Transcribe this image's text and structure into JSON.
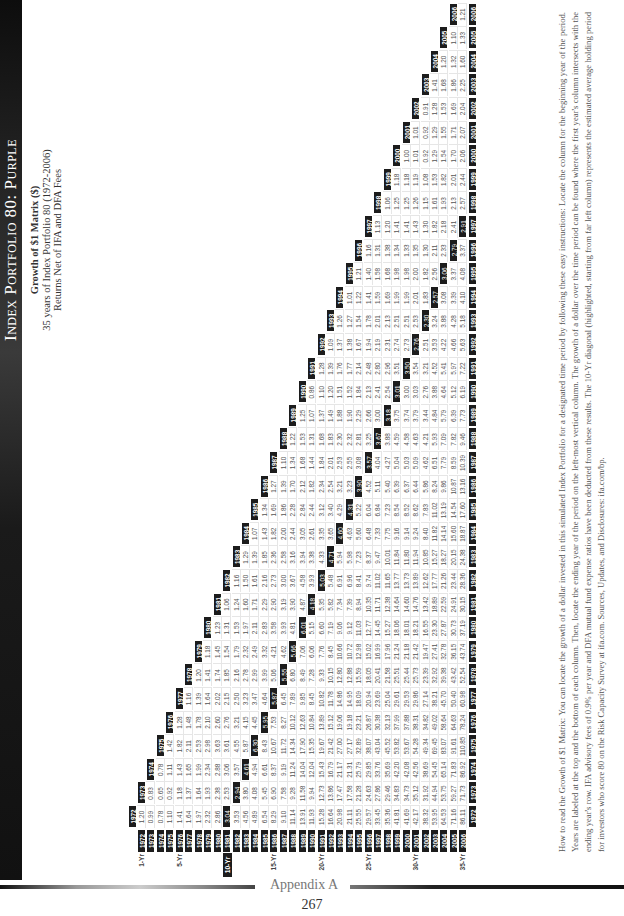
{
  "header": {
    "title": "Index Portfolio 80: Purple",
    "subtitle": "Growth of $1 Matrix ($)",
    "line2": "35 years of Index Portfolio 80 (1972-2006)",
    "line3": "Returns Net of IFA and DFA Fees"
  },
  "footer": {
    "section": "Appendix A",
    "page_number": "267"
  },
  "explanation": "How to read the Growth of $1 Matrix: You can locate the growth of a dollar invested in this simulated Index Portfolio for a designated time period by following these easy instructions: Locate the column for the beginning year of the period. Years are labeled at the top and the bottom of each column. Then, locate the ending year of the period on the left-most vertical column. The growth of a dollar over the time period can be found where the first year's column intersects with the ending year's row. IFA advisory fees of 0.9% per year and DFA mutual fund expense ratios have been deducted from these results. The 10-Yr diagonal (highlighted, starting from far left column) represents the estimated average holding period for investors who score 80 on the Risk Capacity Survey at ifa.com. Sources, Updates, and Disclosures: ifa.com/bp.",
  "matrix": {
    "start_year": 1972,
    "highlight_period_years": 10,
    "period_labels": {
      "1972": "1-Yr",
      "1976": "5-Yr",
      "1981": "10-Yr",
      "1986": "15-Yr",
      "1991": "20-Yr",
      "1996": "25-Yr",
      "2001": "30-Yr",
      "2006": "35-Yr"
    },
    "rows": [
      {
        "end": 1972,
        "values": [
          1.2
        ]
      },
      {
        "end": 1973,
        "values": [
          0.99,
          0.83
        ]
      },
      {
        "end": 1974,
        "values": [
          0.78,
          0.65,
          0.78
        ]
      },
      {
        "end": 1975,
        "values": [
          1.1,
          0.92,
          1.11,
          1.42
        ]
      },
      {
        "end": 1976,
        "values": [
          1.41,
          1.18,
          1.43,
          1.82,
          1.28
        ]
      },
      {
        "end": 1977,
        "values": [
          1.64,
          1.37,
          1.65,
          2.11,
          1.48,
          1.16
        ]
      },
      {
        "end": 1978,
        "values": [
          1.97,
          1.64,
          1.99,
          2.53,
          1.78,
          1.39,
          1.2
        ]
      },
      {
        "end": 1979,
        "values": [
          2.32,
          1.93,
          2.34,
          2.98,
          2.1,
          1.64,
          1.41,
          1.18
        ]
      },
      {
        "end": 1980,
        "values": [
          2.86,
          2.38,
          2.88,
          3.63,
          2.6,
          2.02,
          1.74,
          1.45,
          1.23
        ]
      },
      {
        "end": 1981,
        "values": [
          3.04,
          2.53,
          3.06,
          3.61,
          2.76,
          2.15,
          1.85,
          1.54,
          1.31,
          1.06
        ]
      },
      {
        "end": 1982,
        "values": [
          3.53,
          2.94,
          3.57,
          4.55,
          3.21,
          2.5,
          2.16,
          1.79,
          1.53,
          1.24,
          1.16
        ]
      },
      {
        "end": 1983,
        "values": [
          4.56,
          3.8,
          4.61,
          5.87,
          4.15,
          3.23,
          2.78,
          2.32,
          1.97,
          1.6,
          1.5,
          1.29
        ]
      },
      {
        "end": 1984,
        "values": [
          4.89,
          4.08,
          4.94,
          6.3,
          4.45,
          3.47,
          2.99,
          2.49,
          2.11,
          1.71,
          1.61,
          1.39,
          1.07
        ]
      },
      {
        "end": 1985,
        "values": [
          6.54,
          5.45,
          6.61,
          8.43,
          5.95,
          4.64,
          3.99,
          3.32,
          2.83,
          2.29,
          2.16,
          1.85,
          1.43,
          1.34
        ]
      },
      {
        "end": 1986,
        "values": [
          8.29,
          6.9,
          8.37,
          10.67,
          7.53,
          5.87,
          5.06,
          4.21,
          3.58,
          2.9,
          2.73,
          2.36,
          1.82,
          1.69,
          1.27
        ]
      },
      {
        "end": 1987,
        "values": [
          9.1,
          7.58,
          9.19,
          11.72,
          8.27,
          6.45,
          5.55,
          4.62,
          3.93,
          3.19,
          3.0,
          2.58,
          2.0,
          1.86,
          1.39,
          1.1
        ]
      },
      {
        "end": 1988,
        "values": [
          11.14,
          9.28,
          11.24,
          14.34,
          10.12,
          7.89,
          6.8,
          5.66,
          4.81,
          3.9,
          3.67,
          3.16,
          2.44,
          2.28,
          1.7,
          1.34,
          1.22
        ]
      },
      {
        "end": 1989,
        "values": [
          13.91,
          11.58,
          14.04,
          17.9,
          12.63,
          9.85,
          8.49,
          7.06,
          6.01,
          4.87,
          4.58,
          3.94,
          3.05,
          2.84,
          2.12,
          1.68,
          1.53,
          1.25
        ]
      },
      {
        "end": 1990,
        "values": [
          11.93,
          9.94,
          12.04,
          15.35,
          10.84,
          8.45,
          7.28,
          6.06,
          5.15,
          4.18,
          3.93,
          3.38,
          2.61,
          2.44,
          1.82,
          1.44,
          1.31,
          1.07,
          0.86
        ]
      },
      {
        "end": 1991,
        "values": [
          15.28,
          12.73,
          15.43,
          19.67,
          13.89,
          10.82,
          9.33,
          7.76,
          6.6,
          5.35,
          5.03,
          4.33,
          3.35,
          3.12,
          2.34,
          1.84,
          1.68,
          1.37,
          1.1,
          1.28
        ]
      },
      {
        "end": 1992,
        "values": [
          16.64,
          13.86,
          16.79,
          21.42,
          15.12,
          11.78,
          10.15,
          8.45,
          7.19,
          5.82,
          5.48,
          4.71,
          3.65,
          3.4,
          2.54,
          2.01,
          1.83,
          1.49,
          1.2,
          1.39,
          1.09
        ]
      },
      {
        "end": 1993,
        "values": [
          20.98,
          17.47,
          21.17,
          27.0,
          19.06,
          14.86,
          12.8,
          10.66,
          9.06,
          7.34,
          6.91,
          5.94,
          4.6,
          4.29,
          3.21,
          2.53,
          2.3,
          1.88,
          1.51,
          1.76,
          1.37,
          1.26
        ]
      },
      {
        "end": 1994,
        "values": [
          21.11,
          17.58,
          21.31,
          27.17,
          19.18,
          14.95,
          12.88,
          10.72,
          9.12,
          7.39,
          6.96,
          5.98,
          4.63,
          4.31,
          3.23,
          2.55,
          2.32,
          1.9,
          1.52,
          1.77,
          1.38,
          1.27,
          1.01
        ]
      },
      {
        "end": 1995,
        "values": [
          25.55,
          21.28,
          25.79,
          32.89,
          23.21,
          18.09,
          15.59,
          12.98,
          11.03,
          8.94,
          8.41,
          7.23,
          5.6,
          5.22,
          3.9,
          3.08,
          2.81,
          2.29,
          1.84,
          2.14,
          1.67,
          1.54,
          1.22,
          1.21
        ]
      },
      {
        "end": 1996,
        "values": [
          29.57,
          24.63,
          29.85,
          38.07,
          26.87,
          20.94,
          18.05,
          15.02,
          12.77,
          10.35,
          9.74,
          8.37,
          6.48,
          6.04,
          4.52,
          3.57,
          3.25,
          2.66,
          2.13,
          2.48,
          1.94,
          1.78,
          1.41,
          1.4,
          1.16
        ]
      },
      {
        "end": 1997,
        "values": [
          33.45,
          27.86,
          33.76,
          43.04,
          30.38,
          23.69,
          20.41,
          16.99,
          14.45,
          11.71,
          11.02,
          9.47,
          7.33,
          6.84,
          5.11,
          4.04,
          3.67,
          3.0,
          2.41,
          2.8,
          2.19,
          2.01,
          1.59,
          1.58,
          1.31,
          1.13
        ]
      },
      {
        "end": 1998,
        "values": [
          35.36,
          29.46,
          35.69,
          45.52,
          32.13,
          25.04,
          21.58,
          17.96,
          15.27,
          12.38,
          11.65,
          10.01,
          7.75,
          7.23,
          5.4,
          4.27,
          3.88,
          3.18,
          2.54,
          2.96,
          2.31,
          2.13,
          1.69,
          1.68,
          1.38,
          1.2,
          1.06
        ]
      },
      {
        "end": 1999,
        "values": [
          41.81,
          34.83,
          42.2,
          53.82,
          37.99,
          29.61,
          25.51,
          21.24,
          18.06,
          14.64,
          13.77,
          11.84,
          9.16,
          8.54,
          6.39,
          5.04,
          4.59,
          3.75,
          3.01,
          3.51,
          2.74,
          2.51,
          1.99,
          1.98,
          1.34,
          1.41,
          1.25,
          1.18
        ]
      },
      {
        "end": 2000,
        "values": [
          41.69,
          34.73,
          42.08,
          53.67,
          37.88,
          29.53,
          25.44,
          21.18,
          18.01,
          14.6,
          13.73,
          11.8,
          9.14,
          8.52,
          6.37,
          5.03,
          4.58,
          3.74,
          3.0,
          3.5,
          2.73,
          2.51,
          1.99,
          1.98,
          1.33,
          1.41,
          1.25,
          1.18,
          1.0
        ]
      },
      {
        "end": 2001,
        "values": [
          42.17,
          35.12,
          42.56,
          54.28,
          38.31,
          29.86,
          25.73,
          21.42,
          18.21,
          14.76,
          13.89,
          11.94,
          9.24,
          8.62,
          6.44,
          5.09,
          4.63,
          3.79,
          3.03,
          3.54,
          2.76,
          2.53,
          2.01,
          2.0,
          1.35,
          1.43,
          1.26,
          1.19,
          1.01,
          1.01
        ]
      },
      {
        "end": 2002,
        "values": [
          38.32,
          31.92,
          38.69,
          49.34,
          34.82,
          27.14,
          23.39,
          19.47,
          16.55,
          13.42,
          12.62,
          10.85,
          8.4,
          7.83,
          5.86,
          4.62,
          4.21,
          3.44,
          2.76,
          3.21,
          2.51,
          2.3,
          1.83,
          1.82,
          1.3,
          1.3,
          1.15,
          1.08,
          0.92,
          0.92,
          0.91
        ]
      },
      {
        "end": 2003,
        "values": [
          53.95,
          44.94,
          54.45,
          69.45,
          49.02,
          38.21,
          32.92,
          27.41,
          23.3,
          18.89,
          17.77,
          15.27,
          11.82,
          11.02,
          8.24,
          6.51,
          5.93,
          4.84,
          3.88,
          4.52,
          3.53,
          3.24,
          2.57,
          2.56,
          2.11,
          1.82,
          1.61,
          1.53,
          1.29,
          1.29,
          1.28,
          1.41
        ]
      },
      {
        "end": 2004,
        "values": [
          64.53,
          53.75,
          65.14,
          83.07,
          58.64,
          45.7,
          39.38,
          32.78,
          27.87,
          22.59,
          21.26,
          18.27,
          14.14,
          13.19,
          9.86,
          7.79,
          7.09,
          5.79,
          4.64,
          5.41,
          4.22,
          3.88,
          3.08,
          3.06,
          2.33,
          2.18,
          1.93,
          1.82,
          1.54,
          1.55,
          1.53,
          1.68,
          1.2
        ]
      },
      {
        "end": 2005,
        "values": [
          71.16,
          59.27,
          71.83,
          91.61,
          64.63,
          50.4,
          43.42,
          36.15,
          30.73,
          24.91,
          23.44,
          20.15,
          15.6,
          14.54,
          10.87,
          8.59,
          7.82,
          6.39,
          5.12,
          5.97,
          4.66,
          4.28,
          3.39,
          3.37,
          2.79,
          2.41,
          2.13,
          2.01,
          1.7,
          1.71,
          1.69,
          1.86,
          1.32,
          1.1
        ]
      },
      {
        "end": 2006,
        "values": [
          86.11,
          71.73,
          86.92,
          110.85,
          78.24,
          60.98,
          52.54,
          43.74,
          37.19,
          30.15,
          28.36,
          24.38,
          18.87,
          17.6,
          13.16,
          10.39,
          9.46,
          7.73,
          6.19,
          7.22,
          5.63,
          5.18,
          4.1,
          4.08,
          3.37,
          2.91,
          2.57,
          2.44,
          2.06,
          2.07,
          2.04,
          2.25,
          1.6,
          1.33,
          1.21
        ]
      }
    ]
  },
  "colors": {
    "header_box": "#1c1c1c",
    "grid_line": "#e6e6e6",
    "text": "#555555"
  }
}
